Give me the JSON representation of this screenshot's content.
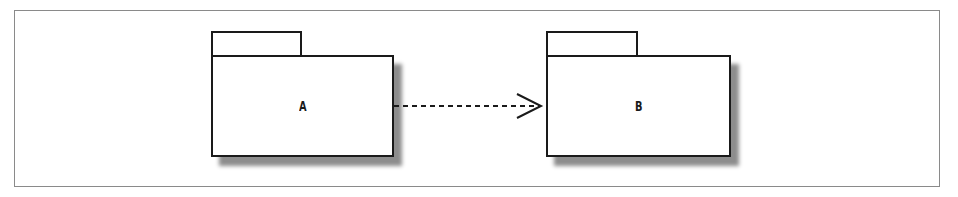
{
  "diagram": {
    "type": "uml-package-dependency",
    "packages": [
      {
        "id": "A",
        "label": "A"
      },
      {
        "id": "B",
        "label": "B"
      }
    ],
    "dependencies": [
      {
        "from": "A",
        "to": "B",
        "style": "dashed",
        "arrowhead": "open"
      }
    ]
  }
}
